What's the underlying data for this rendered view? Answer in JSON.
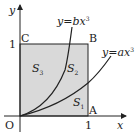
{
  "diagram": {
    "axes": {
      "x_label": "x",
      "y_label": "y",
      "origin_label": "O"
    },
    "ticks": {
      "x_one": "1",
      "y_one": "1"
    },
    "points": {
      "A": "A",
      "B": "B",
      "C": "C"
    },
    "curves": [
      {
        "id": "b",
        "label": "y = bx³",
        "eq_y": "y",
        "eq_eq": "=",
        "eq_rhs": "bx",
        "eq_exp": "3"
      },
      {
        "id": "a",
        "label": "y = ax³",
        "eq_y": "y",
        "eq_eq": "=",
        "eq_rhs": "ax",
        "eq_exp": "3"
      }
    ],
    "regions": {
      "S1": {
        "base": "S",
        "sub": "1"
      },
      "S2": {
        "base": "S",
        "sub": "2"
      },
      "S3": {
        "base": "S",
        "sub": "3"
      }
    },
    "colors": {
      "square_fill": "#d9d9d9",
      "line": "#222222"
    }
  }
}
